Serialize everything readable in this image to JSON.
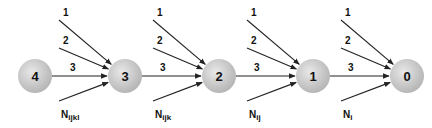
{
  "diagram": {
    "nodes": [
      {
        "id": "4",
        "label": "4"
      },
      {
        "id": "3",
        "label": "3"
      },
      {
        "id": "2",
        "label": "2"
      },
      {
        "id": "1",
        "label": "1"
      },
      {
        "id": "0",
        "label": "0"
      }
    ],
    "incoming_groups": [
      {
        "target": "3",
        "edges": [
          "1",
          "2",
          "3"
        ],
        "extra": {
          "base": "N",
          "sub": "ijkl"
        }
      },
      {
        "target": "2",
        "edges": [
          "1",
          "2",
          "3"
        ],
        "extra": {
          "base": "N",
          "sub": "ijk"
        }
      },
      {
        "target": "1",
        "edges": [
          "1",
          "2",
          "3"
        ],
        "extra": {
          "base": "N",
          "sub": "ij"
        }
      },
      {
        "target": "0",
        "edges": [
          "1",
          "2",
          "3"
        ],
        "extra": {
          "base": "N",
          "sub": "i"
        }
      }
    ],
    "colors": {
      "node_fill": "#c8c8c8",
      "node_highlight": "#e6e6e6",
      "edge": "#222222"
    }
  }
}
